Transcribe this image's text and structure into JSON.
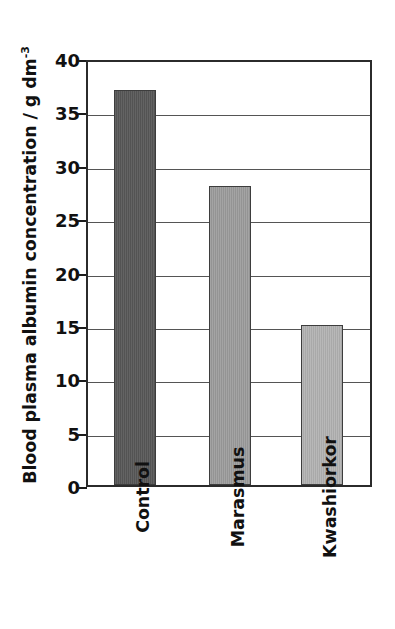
{
  "chart_data": {
    "type": "bar",
    "title": "",
    "subtitle": "",
    "xlabel": "",
    "ylabel": "Blood plasma albumin concentration / g dm",
    "ylabel_exponent": "-3",
    "categories": [
      "Control",
      "Marasmus",
      "Kwashiorkor"
    ],
    "values": [
      37,
      28,
      15
    ],
    "ylim": [
      0,
      40
    ],
    "yticks": [
      0,
      5,
      10,
      15,
      20,
      25,
      30,
      35,
      40
    ],
    "ytick_labels": [
      "0",
      "5",
      "10",
      "15",
      "20",
      "25",
      "30",
      "35",
      "40"
    ],
    "grid": true,
    "grid_axis": "y",
    "legend": false,
    "legend_position": "none",
    "bar_colors": [
      "#575757",
      "#9a9a9a",
      "#b0b0b0"
    ],
    "bar_edge_color": "#3d3d3d",
    "frame_color": "#2b2b2b",
    "gridline_color": "#555555",
    "background_color": "#ffffff",
    "tick_label_color": "#111111",
    "series": [
      {
        "name": "Blood plasma albumin concentration",
        "points": [
          {
            "category": "Control",
            "value": 37,
            "color": "#575757"
          },
          {
            "category": "Marasmus",
            "value": 28,
            "color": "#9a9a9a"
          },
          {
            "category": "Kwashiorkor",
            "value": 15,
            "color": "#b0b0b0"
          }
        ]
      }
    ]
  }
}
